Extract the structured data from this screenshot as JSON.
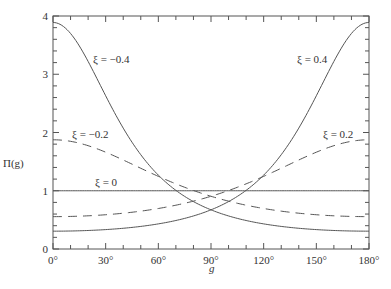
{
  "chart_data": {
    "type": "line",
    "title": "",
    "xlabel": "g",
    "ylabel": "Π(g)",
    "xlim": [
      0,
      180
    ],
    "ylim": [
      0,
      4
    ],
    "grid": false,
    "legend_position": "inline labels",
    "x_ticks": [
      0,
      30,
      60,
      90,
      120,
      150,
      180
    ],
    "x_tick_labels": [
      "0°",
      "30°",
      "60°",
      "90°",
      "120°",
      "150°",
      "180°"
    ],
    "y_ticks": [
      0,
      1,
      2,
      3,
      4
    ],
    "y_tick_labels": [
      "0",
      "1",
      "2",
      "3",
      "4"
    ],
    "x": [
      0,
      15,
      30,
      45,
      60,
      75,
      90,
      105,
      120,
      135,
      150,
      165,
      180
    ],
    "series": [
      {
        "name": "ξ = -0.4",
        "style": "solid",
        "values": [
          3.89,
          3.68,
          3.13,
          2.43,
          1.77,
          1.15,
          0.67,
          0.42,
          0.33,
          0.31,
          0.31,
          0.31,
          0.31
        ]
      },
      {
        "name": "ξ = -0.2",
        "style": "dashed",
        "values": [
          1.88,
          1.84,
          1.72,
          1.54,
          1.33,
          1.12,
          0.91,
          0.76,
          0.66,
          0.6,
          0.57,
          0.56,
          0.56
        ]
      },
      {
        "name": "ξ = 0",
        "style": "solid",
        "values": [
          1,
          1,
          1,
          1,
          1,
          1,
          1,
          1,
          1,
          1,
          1,
          1,
          1
        ]
      },
      {
        "name": "ξ = 0.2",
        "style": "dashed",
        "values": [
          0.56,
          0.56,
          0.57,
          0.6,
          0.66,
          0.76,
          0.91,
          1.12,
          1.33,
          1.54,
          1.72,
          1.84,
          1.88
        ]
      },
      {
        "name": "ξ = 0.4",
        "style": "solid",
        "values": [
          0.31,
          0.31,
          0.31,
          0.31,
          0.33,
          0.42,
          0.67,
          1.15,
          1.77,
          2.43,
          3.13,
          3.68,
          3.89
        ]
      }
    ],
    "formula_hint": "Π(g) = (1 − ξ²) / (1 + ξ² + 2ξ cos g)^{3/2}"
  },
  "labels": {
    "xi_m04": "ξ = −0.4",
    "xi_m02": "ξ = −0.2",
    "xi_0": "ξ = 0",
    "xi_p02": "ξ = 0.2",
    "xi_p04": "ξ = 0.4",
    "xlabel": "g",
    "ylabel": "Π(g)"
  }
}
